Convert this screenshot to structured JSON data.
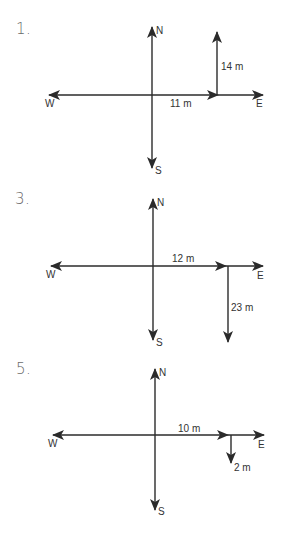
{
  "colors": {
    "line": "#2b2b2b",
    "text": "#333333",
    "number": "#6a6a6a",
    "background": "#ffffff"
  },
  "problems": [
    {
      "number": "1.",
      "compass": {
        "north": "N",
        "south": "S",
        "east": "E",
        "west": "W"
      },
      "vectors": [
        {
          "label": "11 m",
          "direction": "east",
          "magnitude": 11
        },
        {
          "label": "14 m",
          "direction": "north",
          "magnitude": 14
        }
      ]
    },
    {
      "number": "3.",
      "compass": {
        "north": "N",
        "south": "S",
        "east": "E",
        "west": "W"
      },
      "vectors": [
        {
          "label": "12 m",
          "direction": "east",
          "magnitude": 12
        },
        {
          "label": "23 m",
          "direction": "south",
          "magnitude": 23
        }
      ]
    },
    {
      "number": "5.",
      "compass": {
        "north": "N",
        "south": "S",
        "east": "E",
        "west": "W"
      },
      "vectors": [
        {
          "label": "10 m",
          "direction": "east",
          "magnitude": 10
        },
        {
          "label": "2 m",
          "direction": "south",
          "magnitude": 2
        }
      ]
    }
  ]
}
